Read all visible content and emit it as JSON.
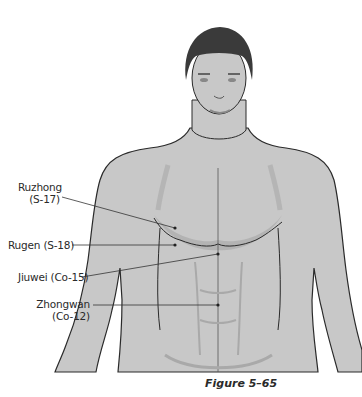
{
  "figure": {
    "caption": "Figure 5–65",
    "colors": {
      "skin": "#c8c8c8",
      "skin_shadow": "#a9a9a9",
      "hair": "#3a3a3a",
      "outline": "#2a2a2a",
      "leader_line": "#333333",
      "text": "#2a2a2a"
    }
  },
  "points": [
    {
      "name": "Ruzhong",
      "code": "(S-17)",
      "line1": "Ruzhong",
      "line2": "(S-17)"
    },
    {
      "name": "Rugen",
      "code": "(S-18)",
      "line1": "Rugen (S-18)"
    },
    {
      "name": "Jiuwei",
      "code": "(Co-15)",
      "line1": "Jiuwei (Co-15)"
    },
    {
      "name": "Zhongwan",
      "code": "(Co-12)",
      "line1": "Zhongwan",
      "line2": "(Co-12)"
    }
  ]
}
